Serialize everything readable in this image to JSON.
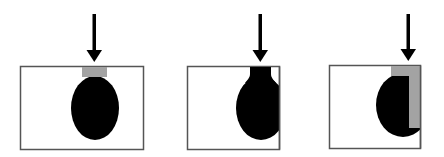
{
  "diagram": {
    "panel_count": 3,
    "colors": {
      "background": "#ffffff",
      "frame": "#555555",
      "body": "#000000",
      "cap": "#a3a3a3",
      "arrow": "#000000"
    },
    "panels": [
      {
        "id": "panel-1",
        "state": "centered-with-cap",
        "arrow_icon": "arrow-down-icon",
        "has_cap": true
      },
      {
        "id": "panel-2",
        "state": "offset-with-neck",
        "arrow_icon": "arrow-down-icon",
        "has_cap": false
      },
      {
        "id": "panel-3",
        "state": "edge-with-l-cap",
        "arrow_icon": "arrow-down-icon",
        "has_cap": true
      }
    ]
  }
}
